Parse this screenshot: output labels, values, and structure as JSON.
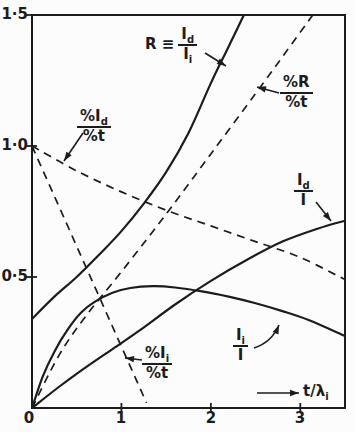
{
  "colors": {
    "ink": "#1c1c1c",
    "background": "#fcfcfc"
  },
  "axes": {
    "y_tick_labels": [
      "1·5",
      "1·0",
      "0·5"
    ],
    "origin_label": "0",
    "x_tick_labels": [
      "1",
      "2",
      "3"
    ],
    "x_axis_label_base": "t/λ",
    "x_axis_label_sub": "i"
  },
  "labels": {
    "R": {
      "prefix": "R ≡",
      "num_base": "I",
      "num_sub": "d",
      "den_base": "I",
      "den_sub": "i"
    },
    "dR": {
      "num": "%R",
      "den": "%t"
    },
    "dId": {
      "num_base": "%I",
      "num_sub": "d",
      "den": "%t"
    },
    "dIi": {
      "num_base": "%I",
      "num_sub": "i",
      "den": "%t"
    },
    "IdI": {
      "num_base": "I",
      "num_sub": "d",
      "den": "I"
    },
    "IiI": {
      "num_base": "I",
      "num_sub": "i",
      "den": "I"
    }
  },
  "chart_data": {
    "type": "line",
    "title": "",
    "xlabel": "t/λi",
    "ylabel": "",
    "xlim": [
      0,
      3.5
    ],
    "ylim": [
      0,
      1.5
    ],
    "x_ticks": [
      0,
      1,
      2,
      3
    ],
    "y_ticks": [
      0,
      0.5,
      1.0,
      1.5
    ],
    "grid": false,
    "legend": "inline-annotations",
    "series": [
      {
        "key": "R",
        "name": "R ≡ Id/Ii",
        "style": "solid",
        "points": [
          [
            0,
            0.34
          ],
          [
            0.25,
            0.425
          ],
          [
            0.5,
            0.5
          ],
          [
            0.75,
            0.585
          ],
          [
            1.0,
            0.675
          ],
          [
            1.25,
            0.78
          ],
          [
            1.5,
            0.9
          ],
          [
            1.75,
            1.05
          ],
          [
            2.0,
            1.24
          ],
          [
            2.2,
            1.38
          ],
          [
            2.37,
            1.5
          ]
        ]
      },
      {
        "key": "dR",
        "name": "%R/%t",
        "style": "dashed",
        "points": [
          [
            0,
            0
          ],
          [
            0.3,
            0.2
          ],
          [
            0.6,
            0.35
          ],
          [
            1.0,
            0.52
          ],
          [
            1.5,
            0.74
          ],
          [
            2.0,
            0.97
          ],
          [
            2.5,
            1.2
          ],
          [
            2.8,
            1.34
          ],
          [
            3.14,
            1.5
          ]
        ]
      },
      {
        "key": "dId",
        "name": "%Id/%t",
        "style": "dashed",
        "points": [
          [
            0,
            1.0
          ],
          [
            0.5,
            0.905
          ],
          [
            1.0,
            0.825
          ],
          [
            1.5,
            0.755
          ],
          [
            2.0,
            0.695
          ],
          [
            2.5,
            0.635
          ],
          [
            3.0,
            0.575
          ],
          [
            3.5,
            0.49
          ]
        ]
      },
      {
        "key": "dIi",
        "name": "%Ii/%t",
        "style": "dashed",
        "points": [
          [
            0,
            1.0
          ],
          [
            1.28,
            0.02
          ]
        ]
      },
      {
        "key": "IdI",
        "name": "Id/I",
        "style": "solid",
        "points": [
          [
            0,
            0
          ],
          [
            0.3,
            0.08
          ],
          [
            0.6,
            0.155
          ],
          [
            0.9,
            0.225
          ],
          [
            1.2,
            0.295
          ],
          [
            1.6,
            0.395
          ],
          [
            2.0,
            0.485
          ],
          [
            2.4,
            0.565
          ],
          [
            2.8,
            0.635
          ],
          [
            3.2,
            0.685
          ],
          [
            3.5,
            0.715
          ]
        ]
      },
      {
        "key": "IiI",
        "name": "Ii/I",
        "style": "solid",
        "points": [
          [
            0,
            0
          ],
          [
            0.12,
            0.12
          ],
          [
            0.25,
            0.215
          ],
          [
            0.4,
            0.3
          ],
          [
            0.55,
            0.365
          ],
          [
            0.7,
            0.405
          ],
          [
            0.9,
            0.44
          ],
          [
            1.1,
            0.458
          ],
          [
            1.35,
            0.465
          ],
          [
            1.6,
            0.46
          ],
          [
            1.9,
            0.445
          ],
          [
            2.2,
            0.425
          ],
          [
            2.5,
            0.4
          ],
          [
            2.8,
            0.37
          ],
          [
            3.1,
            0.335
          ],
          [
            3.5,
            0.275
          ]
        ]
      }
    ]
  }
}
